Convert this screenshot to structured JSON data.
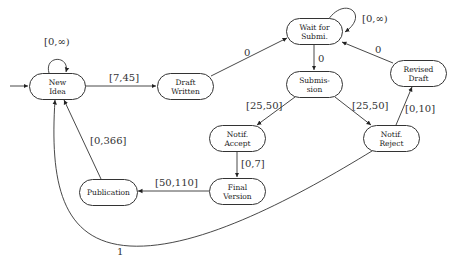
{
  "diagram": {
    "type": "timed state machine",
    "nodes": [
      {
        "id": "new_idea",
        "label": "New\nIdea"
      },
      {
        "id": "draft_written",
        "label": "Draft\nWritten"
      },
      {
        "id": "wait_for_submi",
        "label": "Wait for\nSubmi."
      },
      {
        "id": "submission",
        "label": "Submis-\nsion"
      },
      {
        "id": "revised_draft",
        "label": "Revised\nDraft"
      },
      {
        "id": "notif_accept",
        "label": "Notif.\nAccept"
      },
      {
        "id": "notif_reject",
        "label": "Notif.\nReject"
      },
      {
        "id": "final_version",
        "label": "Final\nVersion"
      },
      {
        "id": "publication",
        "label": "Publication"
      }
    ],
    "edges": [
      {
        "from": "new_idea",
        "to": "new_idea",
        "label": "[0,∞)"
      },
      {
        "from": "new_idea",
        "to": "draft_written",
        "label": "[7,45]"
      },
      {
        "from": "draft_written",
        "to": "wait_for_submi",
        "label": "0"
      },
      {
        "from": "wait_for_submi",
        "to": "wait_for_submi",
        "label": "[0,∞)"
      },
      {
        "from": "wait_for_submi",
        "to": "submission",
        "label": "0"
      },
      {
        "from": "revised_draft",
        "to": "wait_for_submi",
        "label": "0"
      },
      {
        "from": "submission",
        "to": "notif_accept",
        "label": "[25,50]"
      },
      {
        "from": "submission",
        "to": "notif_reject",
        "label": "[25,50]"
      },
      {
        "from": "notif_reject",
        "to": "revised_draft",
        "label": "[0,10]"
      },
      {
        "from": "notif_accept",
        "to": "final_version",
        "label": "[0,7]"
      },
      {
        "from": "final_version",
        "to": "publication",
        "label": "[50,110]"
      },
      {
        "from": "publication",
        "to": "new_idea",
        "label": "[0,366]"
      },
      {
        "from": "notif_reject",
        "to": "new_idea",
        "label": "1"
      }
    ]
  }
}
